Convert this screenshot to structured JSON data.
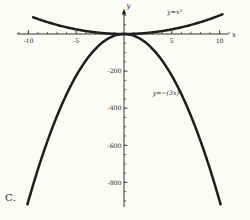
{
  "figure_label": "C.",
  "colors": {
    "background": "#fbfbf7",
    "ink": "#1e1e1e"
  },
  "chart_data": {
    "type": "line",
    "title": "",
    "x_axis": {
      "label": "x",
      "range": [
        -11.3,
        11.9
      ],
      "major_ticks": [
        {
          "value": -10,
          "label": "-10"
        },
        {
          "value": -5,
          "label": "-5"
        },
        {
          "value": 5,
          "label": "5"
        },
        {
          "value": 10,
          "label": "10"
        }
      ],
      "minor_tick_step": 1,
      "minor_tick_range": [
        -11,
        11
      ]
    },
    "y_axis": {
      "label": "y",
      "range": [
        -935,
        140
      ],
      "major_ticks": [
        {
          "value": -200,
          "label": "-200"
        },
        {
          "value": -400,
          "label": "-400"
        },
        {
          "value": -600,
          "label": "-600"
        },
        {
          "value": -800,
          "label": "-800"
        }
      ],
      "minor_tick_step": 50,
      "minor_tick_range": [
        -900,
        100
      ]
    },
    "series": [
      {
        "name": "upper-parabola",
        "formula": "y = x^2",
        "equation_label": "y=x²",
        "coefficient": 1,
        "x_min": -9.5,
        "x_max": 10.3,
        "label_at": {
          "x": 5.3,
          "y": 106
        }
      },
      {
        "name": "lower-parabola",
        "formula": "y = -(3x)^2",
        "equation_label": "y=−(3x)²",
        "coefficient": -9,
        "x_min": -10.1,
        "x_max": 10.1,
        "label_at": {
          "x": 4.5,
          "y": -330
        }
      }
    ],
    "layout": {
      "origin_px": [
        124,
        34
      ],
      "px_per_unit_x": 9.56,
      "px_per_unit_y": 0.1855,
      "x_axis_span_px": [
        17,
        228.5
      ],
      "y_axis_span_px": [
        13,
        207
      ]
    }
  }
}
